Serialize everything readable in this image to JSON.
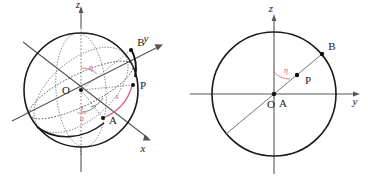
{
  "figure": {
    "panels": [
      {
        "id": "left",
        "name": "sphere-3d-view",
        "axes": [
          {
            "name": "z",
            "label": "z",
            "direction": "up"
          },
          {
            "name": "y",
            "label": "y",
            "direction": "upper-right"
          },
          {
            "name": "x",
            "label": "x",
            "direction": "lower-right"
          }
        ],
        "points": [
          {
            "name": "O",
            "label": "O",
            "role": "origin-center"
          },
          {
            "name": "P",
            "label": "P",
            "role": "point-on-sphere"
          },
          {
            "name": "A",
            "label": "A",
            "role": "point-on-sphere"
          },
          {
            "name": "B",
            "label": "B",
            "role": "point-on-sphere"
          }
        ],
        "annotations": [
          {
            "name": "eta-angle",
            "label": "η",
            "color": "#d4607a"
          },
          {
            "name": "arc-length-s",
            "label": "s",
            "color": "#d4607a"
          },
          {
            "name": "ratio-s-over-a",
            "numerator": "s",
            "denominator": "a",
            "color": "#d4607a"
          }
        ]
      },
      {
        "id": "right",
        "name": "great-circle-plane-view",
        "axes": [
          {
            "name": "z",
            "label": "z",
            "direction": "up"
          },
          {
            "name": "y",
            "label": "y",
            "direction": "right"
          }
        ],
        "points": [
          {
            "name": "O",
            "label": "O",
            "role": "origin-center"
          },
          {
            "name": "A",
            "label": "A",
            "role": "point-on-circle"
          },
          {
            "name": "P",
            "label": "P",
            "role": "point-interior"
          },
          {
            "name": "B",
            "label": "B",
            "role": "point-on-circle"
          }
        ],
        "annotations": [
          {
            "name": "eta-angle",
            "label": "η",
            "color": "#d4607a"
          }
        ]
      }
    ],
    "colors": {
      "stroke": "#1a1a1a",
      "accent_red": "#d4607a",
      "axis_gray": "#555555",
      "background": "#ffffff"
    }
  }
}
